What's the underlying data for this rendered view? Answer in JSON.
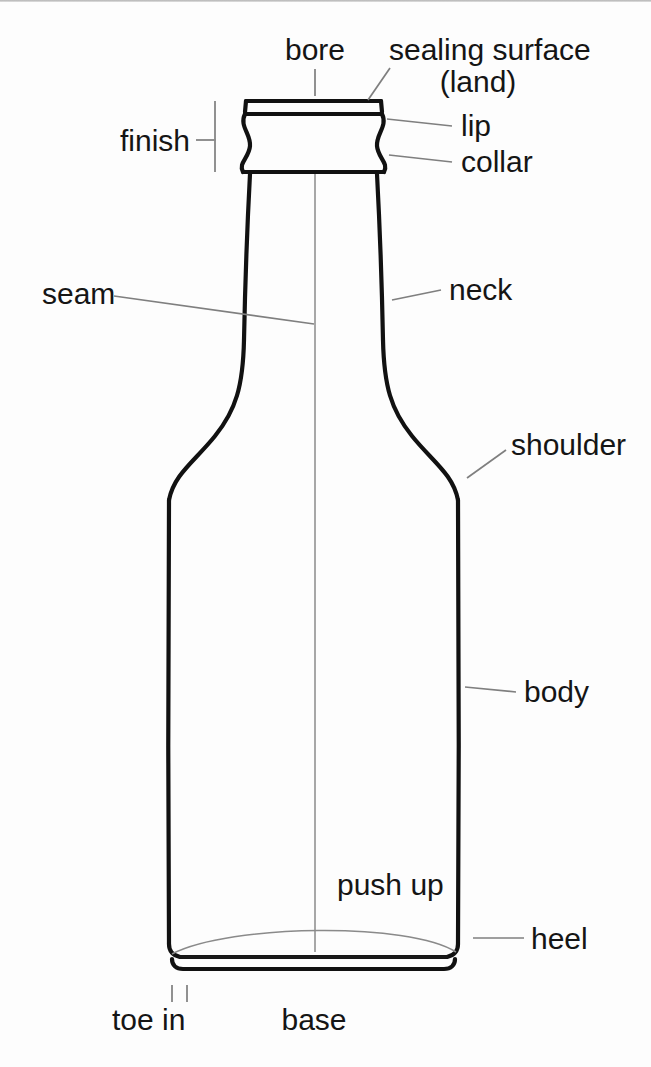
{
  "figure": {
    "background_color": "#fdfdfd",
    "line_color": "#111111",
    "leader_color": "#7f7f7f",
    "text_color": "#151515"
  },
  "labels": {
    "bore": "bore",
    "sealing_surface_line1": "sealing surface",
    "sealing_surface_line2": "(land)",
    "lip": "lip",
    "collar": "collar",
    "finish": "finish",
    "seam": "seam",
    "neck": "neck",
    "shoulder": "shoulder",
    "body": "body",
    "push_up": "push up",
    "heel": "heel",
    "toe_in": "toe in",
    "base": "base"
  }
}
